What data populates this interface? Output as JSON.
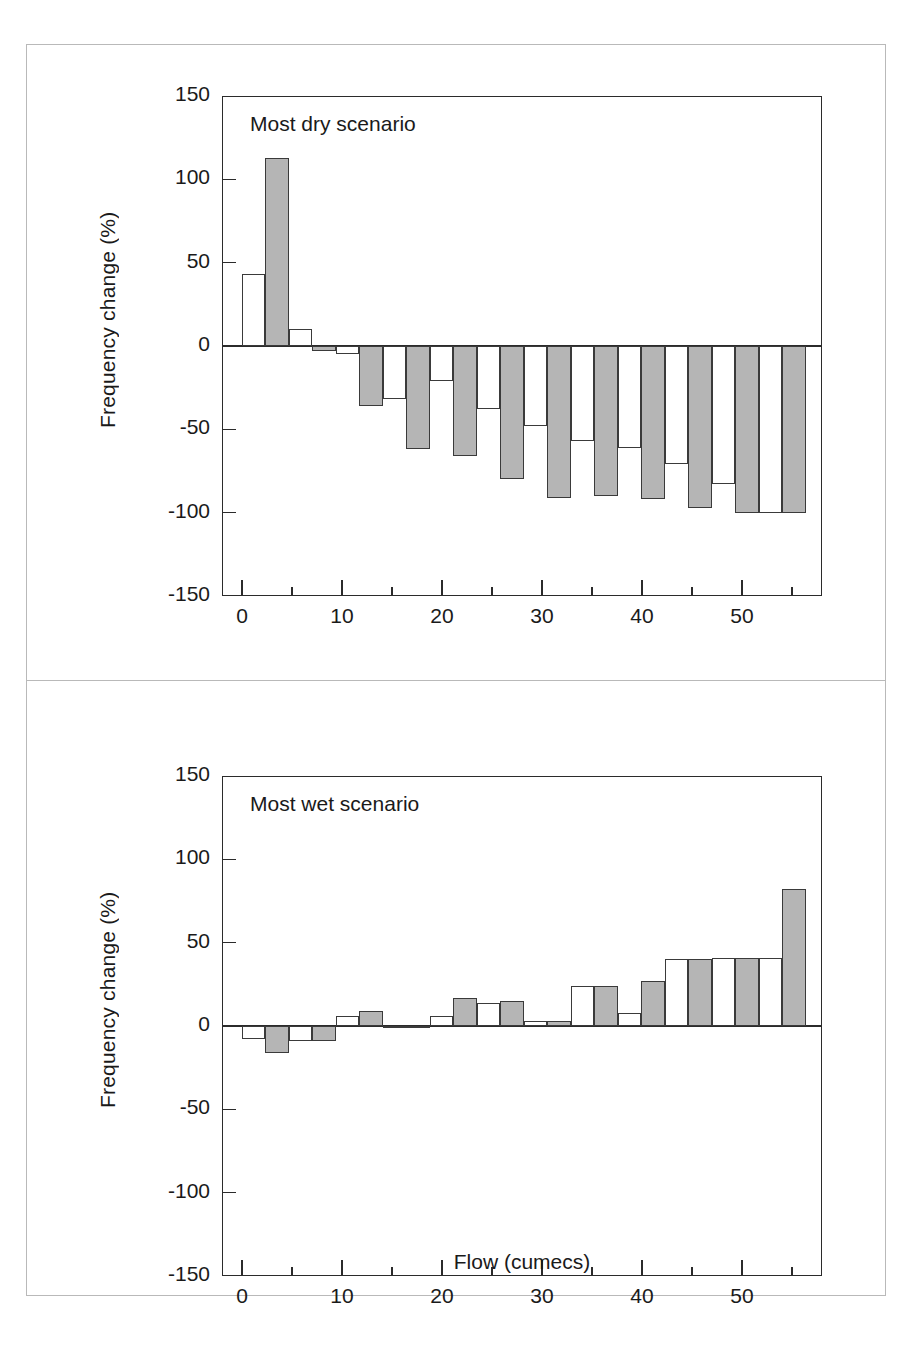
{
  "figure": {
    "background": "#ffffff",
    "frame_color": "#b9b9b9",
    "axis_color": "#2b2b2b",
    "series_colors": {
      "open": "#ffffff",
      "filled": "#b5b5b5"
    },
    "xlabel": "Flow (cumecs)",
    "ylabel": "Frequency change (%)"
  },
  "axes": {
    "y_ticks": [
      "150",
      "100",
      "50",
      "0",
      "-50",
      "-100",
      "-150"
    ],
    "y_tick_values": [
      150,
      100,
      50,
      0,
      -50,
      -100,
      -150
    ],
    "x_major_ticks": [
      "0",
      "10",
      "20",
      "30",
      "40",
      "50"
    ],
    "x_major_values": [
      0,
      10,
      20,
      30,
      40,
      50
    ],
    "x_minor_values": [
      5,
      15,
      25,
      35,
      45,
      55
    ],
    "xlim": [
      -2,
      58
    ],
    "ylim": [
      -150,
      150
    ]
  },
  "chart_data": [
    {
      "type": "bar",
      "title": "Most dry scenario",
      "xlabel": "Flow (cumecs)",
      "ylabel": "Frequency change (%)",
      "xlim": [
        -2,
        58
      ],
      "ylim": [
        -150,
        150
      ],
      "grid": false,
      "legend": "none",
      "x": [
        2.3,
        7.0,
        11.7,
        16.4,
        21.1,
        25.8,
        30.5,
        35.2,
        39.9,
        44.6,
        49.3,
        54.0
      ],
      "bar_width": 4.7,
      "series": [
        {
          "name": "open",
          "fill": "#ffffff",
          "values": [
            43,
            10,
            -5,
            -32,
            -21,
            -38,
            -48,
            -57,
            -61,
            -71,
            -83,
            -100
          ]
        },
        {
          "name": "filled",
          "fill": "#b5b5b5",
          "values": [
            113,
            -3,
            -36,
            -62,
            -66,
            -80,
            -91,
            -90,
            -92,
            -97,
            -100,
            -100
          ]
        }
      ]
    },
    {
      "type": "bar",
      "title": "Most wet scenario",
      "xlabel": "Flow (cumecs)",
      "ylabel": "Frequency change (%)",
      "xlim": [
        -2,
        58
      ],
      "ylim": [
        -150,
        150
      ],
      "grid": false,
      "legend": "none",
      "x": [
        2.3,
        7.0,
        11.7,
        16.4,
        21.1,
        25.8,
        30.5,
        35.2,
        39.9,
        44.6,
        49.3,
        54.0
      ],
      "bar_width": 4.7,
      "series": [
        {
          "name": "open",
          "fill": "#ffffff",
          "values": [
            -8,
            -9,
            6,
            -1,
            6,
            14,
            3,
            24,
            8,
            40,
            41,
            41
          ]
        },
        {
          "name": "filled",
          "fill": "#b5b5b5",
          "values": [
            -16,
            -9,
            9,
            -1,
            17,
            15,
            3,
            24,
            27,
            40,
            41,
            82
          ]
        }
      ]
    }
  ]
}
